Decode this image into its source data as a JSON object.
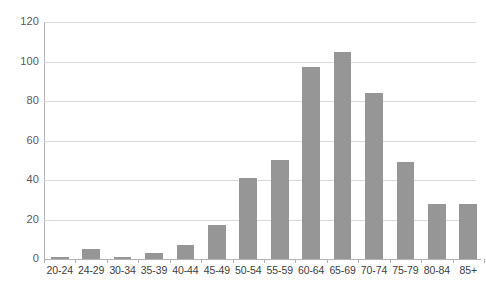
{
  "chart_data": {
    "type": "bar",
    "title": "",
    "subtitle": "",
    "xlabel": "",
    "ylabel": "",
    "categories": [
      "20-24",
      "24-29",
      "30-34",
      "35-39",
      "40-44",
      "45-49",
      "50-54",
      "55-59",
      "60-64",
      "65-69",
      "70-74",
      "75-79",
      "80-84",
      "85+"
    ],
    "values": [
      1,
      5,
      1,
      3,
      7,
      17,
      41,
      50,
      97,
      105,
      84,
      49,
      28,
      28
    ],
    "ylim": [
      0,
      120
    ],
    "ytick_values": [
      0,
      20,
      40,
      60,
      80,
      100,
      120
    ],
    "ytick_labels": [
      "0",
      "20",
      "40",
      "60",
      "80",
      "100",
      "120"
    ],
    "grid": true,
    "legend": false,
    "legend_position": "none",
    "series": [
      {
        "name": "",
        "color": "#969696",
        "values": [
          1,
          5,
          1,
          3,
          7,
          17,
          41,
          50,
          97,
          105,
          84,
          49,
          28,
          28
        ]
      }
    ]
  },
  "colors": {
    "bar": "#969696",
    "gridline": "#d9d9d9",
    "axis": "#b3b3b3",
    "tick_text": "#595959",
    "category_text": "#404040",
    "background": "#ffffff"
  }
}
